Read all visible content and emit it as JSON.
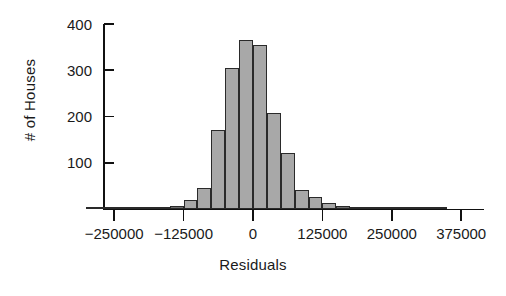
{
  "chart_data": {
    "type": "bar",
    "title": "",
    "subtitle": "",
    "xlabel": "Residuals",
    "ylabel": "# of Houses",
    "xlim": [
      -312500,
      437500
    ],
    "ylim": [
      0,
      420
    ],
    "grid": false,
    "legend": null,
    "y_ticks": [
      100,
      200,
      300,
      400
    ],
    "y_tick_labels": [
      "100",
      "200",
      "300",
      "400"
    ],
    "x_ticks": [
      -250000,
      -125000,
      0,
      125000,
      250000,
      375000
    ],
    "x_tick_labels": [
      "−250000",
      "−125000",
      "0",
      "125000",
      "250000",
      "375000"
    ],
    "bin_width": 25000,
    "bars": [
      {
        "bin_start": -300000,
        "bin_center": -287500,
        "value": 1
      },
      {
        "bin_start": -275000,
        "bin_center": -262500,
        "value": 2
      },
      {
        "bin_start": -250000,
        "bin_center": -237500,
        "value": 3
      },
      {
        "bin_start": -225000,
        "bin_center": -212500,
        "value": 3
      },
      {
        "bin_start": -200000,
        "bin_center": -187500,
        "value": 2
      },
      {
        "bin_start": -175000,
        "bin_center": -162500,
        "value": 4
      },
      {
        "bin_start": -150000,
        "bin_center": -137500,
        "value": 6
      },
      {
        "bin_start": -125000,
        "bin_center": -112500,
        "value": 19
      },
      {
        "bin_start": -100000,
        "bin_center": -87500,
        "value": 46
      },
      {
        "bin_start": -75000,
        "bin_center": -62500,
        "value": 171
      },
      {
        "bin_start": -50000,
        "bin_center": -37500,
        "value": 305
      },
      {
        "bin_start": -25000,
        "bin_center": -12500,
        "value": 365
      },
      {
        "bin_start": 0,
        "bin_center": 12500,
        "value": 354
      },
      {
        "bin_start": 25000,
        "bin_center": 37500,
        "value": 208
      },
      {
        "bin_start": 50000,
        "bin_center": 62500,
        "value": 121
      },
      {
        "bin_start": 75000,
        "bin_center": 87500,
        "value": 41
      },
      {
        "bin_start": 100000,
        "bin_center": 112500,
        "value": 26
      },
      {
        "bin_start": 125000,
        "bin_center": 137500,
        "value": 13
      },
      {
        "bin_start": 150000,
        "bin_center": 162500,
        "value": 6
      },
      {
        "bin_start": 175000,
        "bin_center": 187500,
        "value": 4
      },
      {
        "bin_start": 200000,
        "bin_center": 212500,
        "value": 2
      },
      {
        "bin_start": 225000,
        "bin_center": 237500,
        "value": 2
      },
      {
        "bin_start": 250000,
        "bin_center": 262500,
        "value": 4
      },
      {
        "bin_start": 275000,
        "bin_center": 287500,
        "value": 4
      },
      {
        "bin_start": 300000,
        "bin_center": 312500,
        "value": 1
      },
      {
        "bin_start": 325000,
        "bin_center": 337500,
        "value": 1
      }
    ],
    "colors": {
      "bar_fill": "#a8a8a8",
      "bar_edge": "#2a2a2a",
      "axis": "#111111",
      "text": "#1a1a1a",
      "background": "#ffffff"
    }
  }
}
